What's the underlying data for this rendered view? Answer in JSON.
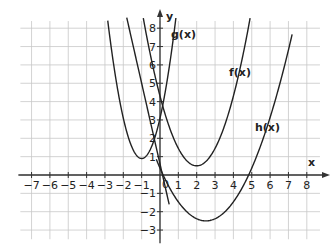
{
  "chart_data": {
    "type": "line",
    "title": "",
    "xlabel": "x",
    "ylabel": "y",
    "xlim": [
      -7.5,
      8.5
    ],
    "ylim": [
      -3.5,
      8.5
    ],
    "grid": true,
    "x_ticks": [
      -7,
      -6,
      -5,
      -4,
      -3,
      -2,
      -1,
      1,
      2,
      3,
      4,
      5,
      6,
      7,
      8
    ],
    "y_ticks": [
      -3,
      -2,
      -1,
      1,
      2,
      3,
      4,
      5,
      6,
      7,
      8
    ],
    "origin_label": "0",
    "series": [
      {
        "name": "f(x)",
        "equation": "(x-2)^2 + 0.5",
        "vertex": [
          2,
          0.5
        ],
        "label_pos": [
          4,
          5.3
        ]
      },
      {
        "name": "g(x)",
        "equation": "(x+1)^2 + 1 (approx.)",
        "vertex": [
          -1,
          1
        ],
        "label_pos": [
          0.5,
          7.3
        ]
      },
      {
        "name": "h(x)",
        "equation": "0.5(x-2.5)^2 - 2.5",
        "vertex": [
          2.5,
          -2.5
        ],
        "label_pos": [
          5.5,
          1.5
        ]
      },
      {
        "name": "line",
        "equation": "steep line through (0,0)",
        "note": "unlabeled steep curve passing near origin"
      }
    ]
  },
  "labels": {
    "x_axis": "x",
    "y_axis": "y",
    "origin": "0",
    "f": "f(x)",
    "g": "g(x)",
    "h": "h(x)"
  }
}
